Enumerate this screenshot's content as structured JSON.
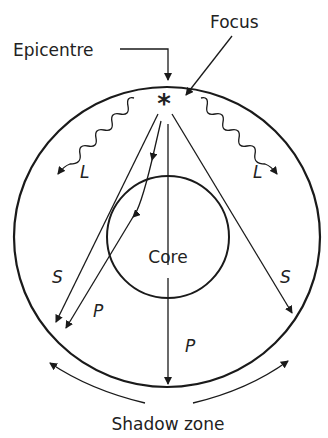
{
  "diagram": {
    "labels": {
      "epicentre": "Epicentre",
      "focus": "Focus",
      "core": "Core",
      "shadow_zone": "Shadow zone",
      "focus_symbol": "*"
    },
    "waves": {
      "l_left": "L",
      "l_right": "L",
      "s_left": "S",
      "s_right": "S",
      "p_left": "P",
      "p_center": "P"
    },
    "colors": {
      "stroke": "#1a1a1a",
      "background": "#ffffff"
    }
  }
}
